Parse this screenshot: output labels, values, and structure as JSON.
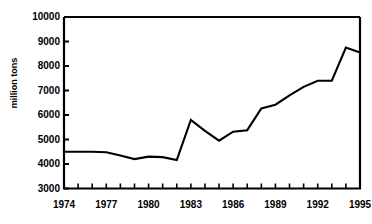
{
  "chart_data": {
    "type": "line",
    "title": "",
    "xlabel": "",
    "ylabel": "million tons",
    "x": [
      1974,
      1975,
      1976,
      1977,
      1978,
      1979,
      1980,
      1981,
      1982,
      1983,
      1984,
      1985,
      1986,
      1987,
      1988,
      1989,
      1990,
      1991,
      1992,
      1993,
      1994,
      1995
    ],
    "values": [
      4500,
      4500,
      4500,
      4480,
      4350,
      4200,
      4300,
      4280,
      4160,
      5800,
      5350,
      4950,
      5320,
      5380,
      6270,
      6420,
      6800,
      7150,
      7400,
      7400,
      8750,
      8550
    ],
    "series": [
      {
        "name": "million tons",
        "values": [
          4500,
          4500,
          4500,
          4480,
          4350,
          4200,
          4300,
          4280,
          4160,
          5800,
          5350,
          4950,
          5320,
          5380,
          6270,
          6420,
          6800,
          7150,
          7400,
          7400,
          8750,
          8550
        ]
      }
    ],
    "xlim": [
      1974,
      1995
    ],
    "ylim": [
      3000,
      10000
    ],
    "yticks": [
      3000,
      4000,
      5000,
      6000,
      7000,
      8000,
      9000,
      10000
    ],
    "ytick_labels": [
      "3000",
      "4000",
      "5000",
      "6000",
      "7000",
      "8000",
      "9000",
      "10000"
    ],
    "xticks": [
      1974,
      1975,
      1976,
      1977,
      1978,
      1979,
      1980,
      1981,
      1982,
      1983,
      1984,
      1985,
      1986,
      1987,
      1988,
      1989,
      1990,
      1991,
      1992,
      1993,
      1994,
      1995
    ],
    "xtick_labels_shown": [
      "1974",
      "1977",
      "1980",
      "1983",
      "1986",
      "1989",
      "1992",
      "1995"
    ],
    "xtick_label_values": [
      1974,
      1977,
      1980,
      1983,
      1986,
      1989,
      1992,
      1995
    ],
    "grid": false,
    "legend": false,
    "line_color": "#000000",
    "axis_color": "#000000",
    "background_color": "#ffffff"
  }
}
